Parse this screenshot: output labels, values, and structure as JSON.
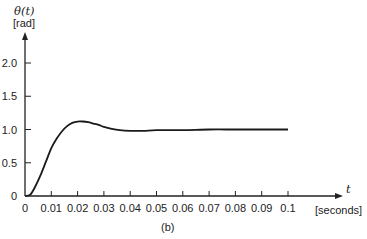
{
  "chart_data": {
    "type": "line",
    "title": "",
    "caption": "(b)",
    "ylabel": "θ(t)",
    "ylabel_unit": "[rad]",
    "xlabel": "t",
    "xlabel_unit": "[seconds]",
    "xlim": [
      0,
      0.1
    ],
    "ylim": [
      0,
      2.0
    ],
    "x_ticks": [
      "0",
      "0.01",
      "0.02",
      "0.03",
      "0.04",
      "0.05",
      "0.06",
      "0.07",
      "0.08",
      "0.09",
      "0.1"
    ],
    "y_ticks": [
      "0",
      "0.5",
      "1.0",
      "1.5",
      "2.0"
    ],
    "grid": false,
    "series": [
      {
        "name": "θ(t)",
        "x": [
          0,
          0.002,
          0.004,
          0.006,
          0.008,
          0.01,
          0.012,
          0.014,
          0.016,
          0.018,
          0.02,
          0.022,
          0.024,
          0.026,
          0.028,
          0.03,
          0.033,
          0.036,
          0.04,
          0.045,
          0.05,
          0.06,
          0.07,
          0.08,
          0.09,
          0.1
        ],
        "values": [
          0,
          0.02,
          0.15,
          0.32,
          0.52,
          0.72,
          0.86,
          0.97,
          1.05,
          1.1,
          1.12,
          1.12,
          1.11,
          1.09,
          1.07,
          1.04,
          1.01,
          0.99,
          0.98,
          0.98,
          0.99,
          0.99,
          1.0,
          1.0,
          1.0,
          1.0
        ]
      }
    ]
  }
}
